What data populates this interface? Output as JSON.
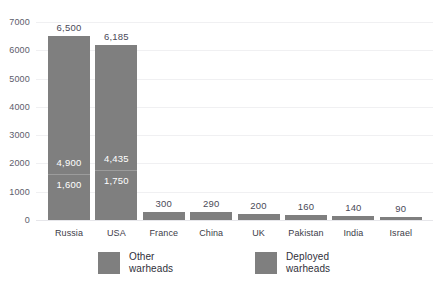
{
  "chart_data": {
    "type": "bar",
    "subtype": "stacked-bar",
    "title": "",
    "subtitle": "",
    "xlabel": "",
    "ylabel": "",
    "ylim": [
      0,
      7000
    ],
    "grid": true,
    "legend_position": "bottom",
    "categories": [
      "Russia",
      "USA",
      "France",
      "China",
      "UK",
      "Pakistan",
      "India",
      "Israel"
    ],
    "yticks": [
      "0",
      "1000",
      "2000",
      "3000",
      "4000",
      "5000",
      "6000",
      "7000"
    ],
    "ytick_values": [
      0,
      1000,
      2000,
      3000,
      4000,
      5000,
      6000,
      7000
    ],
    "series": [
      {
        "name": "Deployed warheads",
        "values": [
          1600,
          1750,
          0,
          0,
          0,
          0,
          0,
          0
        ],
        "labels": [
          "1,600",
          "1,750",
          "",
          "",
          "",
          "",
          "",
          ""
        ],
        "color": "#7f7f7f"
      },
      {
        "name": "Other warheads",
        "values": [
          4900,
          4435,
          300,
          290,
          200,
          160,
          140,
          90
        ],
        "labels": [
          "4,900",
          "4,435",
          "",
          "",
          "",
          "",
          "",
          ""
        ],
        "color": "#7f7f7f"
      }
    ],
    "totals": [
      6500,
      6185,
      300,
      290,
      200,
      160,
      140,
      90
    ],
    "total_labels": [
      "6,500",
      "6,185",
      "300",
      "290",
      "200",
      "160",
      "140",
      "90"
    ]
  },
  "legend": {
    "items": [
      {
        "line1": "Other",
        "line2": "warheads",
        "color": "#7f7f7f"
      },
      {
        "line1": "Deployed",
        "line2": "warheads",
        "color": "#7f7f7f"
      }
    ]
  },
  "colors": {
    "bar": "#7f7f7f",
    "gridline": "#f0f0f2",
    "baseline": "#e6e6ea",
    "axis_text": "#5d5d6b",
    "category_text": "#3c3c48",
    "total_text": "#4a4a58",
    "inner_text": "#ffffff",
    "background": "#ffffff"
  }
}
